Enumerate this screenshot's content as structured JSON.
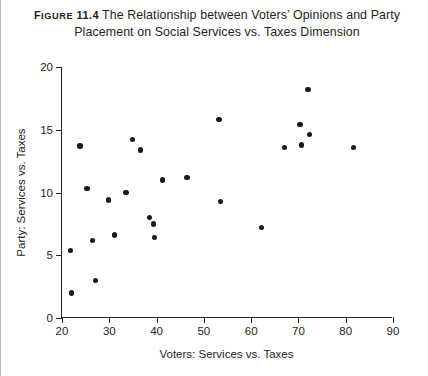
{
  "caption": {
    "figure_label_prefix": "F",
    "figure_label_rest": "IGURE",
    "figure_number": "11.4",
    "line1": "The Relationship between Voters’ Opinions and Party",
    "line2": "Placement on Social Services vs. Taxes Dimension"
  },
  "chart_data": {
    "type": "scatter",
    "title": "The Relationship between Voters’ Opinions and Party Placement on Social Services vs. Taxes Dimension",
    "xlabel": "Voters: Services vs. Taxes",
    "ylabel": "Party: Services vs. Taxes",
    "xlim": [
      20,
      90
    ],
    "ylim": [
      0,
      20
    ],
    "xticks": [
      20,
      30,
      40,
      50,
      60,
      70,
      80,
      90
    ],
    "yticks": [
      0,
      5,
      10,
      15,
      20
    ],
    "xtick_labels": [
      "20",
      "30",
      "40",
      "50",
      "60",
      "70",
      "80",
      "90"
    ],
    "ytick_labels": [
      "0",
      "5",
      "10",
      "15",
      "20"
    ],
    "grid": false,
    "legend": null,
    "marker": "filled-circle",
    "marker_color": "#1a1a1a",
    "points": [
      {
        "x": 22.0,
        "y": 2.0
      },
      {
        "x": 21.8,
        "y": 5.4
      },
      {
        "x": 23.8,
        "y": 13.7
      },
      {
        "x": 25.3,
        "y": 10.3
      },
      {
        "x": 26.5,
        "y": 6.2
      },
      {
        "x": 27.1,
        "y": 3.0
      },
      {
        "x": 29.8,
        "y": 9.4
      },
      {
        "x": 31.1,
        "y": 6.6
      },
      {
        "x": 33.5,
        "y": 10.0
      },
      {
        "x": 34.9,
        "y": 14.2
      },
      {
        "x": 36.6,
        "y": 13.4
      },
      {
        "x": 38.5,
        "y": 8.0
      },
      {
        "x": 39.3,
        "y": 7.5
      },
      {
        "x": 39.6,
        "y": 6.4
      },
      {
        "x": 41.3,
        "y": 11.0
      },
      {
        "x": 46.4,
        "y": 11.2
      },
      {
        "x": 53.2,
        "y": 15.8
      },
      {
        "x": 53.5,
        "y": 9.3
      },
      {
        "x": 62.2,
        "y": 7.2
      },
      {
        "x": 67.0,
        "y": 13.6
      },
      {
        "x": 70.3,
        "y": 15.4
      },
      {
        "x": 70.6,
        "y": 13.8
      },
      {
        "x": 72.0,
        "y": 18.2
      },
      {
        "x": 72.3,
        "y": 14.6
      },
      {
        "x": 81.6,
        "y": 13.6
      }
    ]
  }
}
